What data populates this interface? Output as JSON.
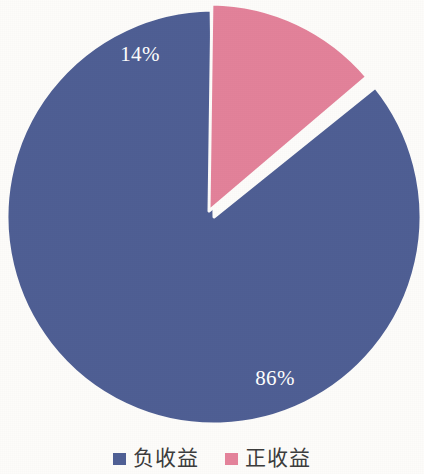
{
  "chart_data": {
    "type": "pie",
    "title": "",
    "subtitle": "",
    "xlabel": "",
    "ylabel": "",
    "grid": false,
    "legend_position": "bottom",
    "start_angle_deg": 0,
    "direction": "counterclockwise",
    "categories": [
      "负收益",
      "正收益"
    ],
    "values": [
      86,
      14
    ],
    "value_unit": "%",
    "data_labels": [
      "86%",
      "14%"
    ],
    "colors": [
      "#4f5f94",
      "#e3829a"
    ],
    "slices": [
      {
        "name": "负收益",
        "value": 86,
        "label": "86%",
        "color": "#4f5f94",
        "exploded": false,
        "label_x": 275,
        "label_y": 380
      },
      {
        "name": "正收益",
        "value": 14,
        "label": "14%",
        "color": "#e3829a",
        "exploded": true,
        "label_x": 140,
        "label_y": 56
      }
    ]
  },
  "geometry": {
    "center_x": 214,
    "center_y": 217,
    "radius": 207,
    "explode_offset_x": -5,
    "explode_offset_y": -6,
    "gap_deg": 1.6
  },
  "legend": {
    "items": [
      {
        "label": "负收益",
        "color": "#4f5f94",
        "swatch_name": "legend-swatch-negative-return"
      },
      {
        "label": "正收益",
        "color": "#e3829a",
        "swatch_name": "legend-swatch-positive-return"
      }
    ]
  },
  "theme": {
    "background": "#fdfcfa",
    "label_text_color": "#ffffff",
    "legend_text_color": "#3c3c3c",
    "slice_separator_color": "#fdfcfa"
  }
}
